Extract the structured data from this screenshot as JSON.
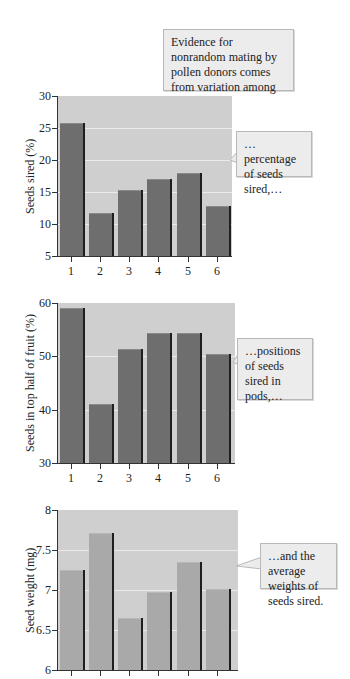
{
  "intro_callout": "Evidence for nonrandom mating by pollen donors comes from variation among donors in…",
  "colors": {
    "plot_background": "#cfcfcf",
    "bar_dark": "#6e6e6e",
    "bar_light": "#a9a9a9",
    "gridline": "#ebebeb",
    "callout_background": "#ececec"
  },
  "chart_data": [
    {
      "type": "bar",
      "title": "",
      "xlabel": "",
      "ylabel": "Seeds sired (%)",
      "categories": [
        "1",
        "2",
        "3",
        "4",
        "5",
        "6"
      ],
      "values": [
        25.8,
        11.7,
        15.3,
        17.0,
        18.0,
        12.8
      ],
      "ylim": [
        5,
        30
      ],
      "yticks": [
        "5",
        "10",
        "15",
        "20",
        "25",
        "30"
      ],
      "grid": true,
      "annotation": "…percentage of seeds sired,…"
    },
    {
      "type": "bar",
      "title": "",
      "xlabel": "",
      "ylabel": "Seeds in top half of fruit (%)",
      "categories": [
        "1",
        "2",
        "3",
        "4",
        "5",
        "6"
      ],
      "values": [
        59.0,
        41.0,
        51.3,
        54.3,
        54.3,
        50.5
      ],
      "ylim": [
        30,
        60
      ],
      "yticks": [
        "30",
        "40",
        "50",
        "60"
      ],
      "grid": true,
      "annotation": "…positions of seeds sired in pods,…"
    },
    {
      "type": "bar",
      "title": "",
      "xlabel": "",
      "ylabel": "Seed weight (mg)",
      "categories": [
        "1",
        "2",
        "3",
        "4",
        "5",
        "6"
      ],
      "values": [
        7.25,
        7.71,
        6.65,
        6.97,
        7.35,
        7.01
      ],
      "ylim": [
        6,
        8
      ],
      "yticks": [
        "6",
        "6.5",
        "7",
        "7.5",
        "8"
      ],
      "grid": true,
      "annotation": "…and the average weights of seeds sired."
    }
  ]
}
